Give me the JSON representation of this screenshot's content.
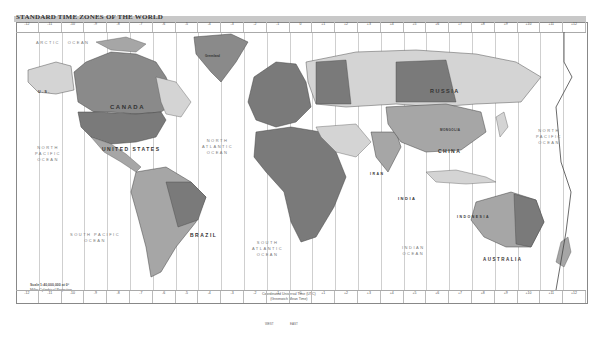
{
  "title": "STANDARD TIME ZONES OF THE WORLD",
  "colors": {
    "frame": "#888888",
    "land_dark": "#7a7a7a",
    "land_mid": "#a6a6a6",
    "land_light": "#d4d4d4",
    "water": "#ffffff",
    "meridian": "#cfcfcf"
  },
  "zone_strip_top": [
    "-12",
    "-11",
    "-10",
    "-9",
    "-8",
    "-7",
    "-6",
    "-5",
    "-4",
    "-3",
    "-2",
    "-1",
    "0",
    "+1",
    "+2",
    "+3",
    "+4",
    "+5",
    "+6",
    "+7",
    "+8",
    "+9",
    "+10",
    "+11",
    "+12"
  ],
  "zone_strip_bottom": [
    "-12",
    "-11",
    "-10",
    "-9",
    "-8",
    "-7",
    "-6",
    "-5",
    "-4",
    "-3",
    "-2",
    "-1",
    "0",
    "+1",
    "+2",
    "+3",
    "+4",
    "+5",
    "+6",
    "+7",
    "+8",
    "+9",
    "+10",
    "+11",
    "+12"
  ],
  "countries": {
    "canada": "CANADA",
    "united_states": "UNITED STATES",
    "russia": "RUSSIA",
    "china": "CHINA",
    "brazil": "BRAZIL",
    "india": "INDIA",
    "iran": "IRAN",
    "australia": "AUSTRALIA",
    "indonesia": "INDONESIA",
    "greenland": "Greenland",
    "us_alaska": "U.S.",
    "mongolia": "MONGOLIA",
    "new_zealand": "NEW ZEALAND",
    "africa": "AFRICA"
  },
  "oceans": {
    "arctic": "ARCTIC   OCEAN",
    "north_pacific_west": "NORTH\nPACIFIC\nOCEAN",
    "north_pacific_east": "NORTH\nPACIFIC\nOCEAN",
    "north_atlantic": "NORTH\nATLANTIC\nOCEAN",
    "south_pacific": "SOUTH PACIFIC\nOCEAN",
    "south_atlantic": "SOUTH\nATLANTIC\nOCEAN",
    "indian": "INDIAN\nOCEAN"
  },
  "legend": {
    "scale": "Scale 1:40,000,000 at 0°",
    "projection": "Miller Cylindrical Projection",
    "utc_note": "Coordinated Universal Time (UTC)\n(Greenwich Mean Time)"
  },
  "footer": {
    "west_label": "WEST",
    "east_label": "EAST"
  }
}
